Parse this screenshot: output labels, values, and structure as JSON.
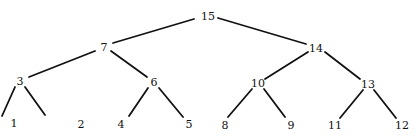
{
  "diagram": {
    "type": "binary-tree",
    "nodes": [
      {
        "id": "n15",
        "label": "15",
        "x": 208,
        "y": 16
      },
      {
        "id": "n7",
        "label": "7",
        "x": 104,
        "y": 47
      },
      {
        "id": "n14",
        "label": "14",
        "x": 316,
        "y": 48
      },
      {
        "id": "n3",
        "label": "3",
        "x": 20,
        "y": 81
      },
      {
        "id": "n6",
        "label": "6",
        "x": 154,
        "y": 82
      },
      {
        "id": "n10",
        "label": "10",
        "x": 258,
        "y": 83
      },
      {
        "id": "n13",
        "label": "13",
        "x": 368,
        "y": 84
      },
      {
        "id": "n1",
        "label": "1",
        "x": 14,
        "y": 123
      },
      {
        "id": "n2",
        "label": "2",
        "x": 81,
        "y": 124
      },
      {
        "id": "n4",
        "label": "4",
        "x": 121,
        "y": 124
      },
      {
        "id": "n5",
        "label": "5",
        "x": 189,
        "y": 124
      },
      {
        "id": "n8",
        "label": "8",
        "x": 225,
        "y": 125
      },
      {
        "id": "n9",
        "label": "9",
        "x": 291,
        "y": 125
      },
      {
        "id": "n11",
        "label": "11",
        "x": 335,
        "y": 125
      },
      {
        "id": "n12",
        "label": "12",
        "x": 402,
        "y": 125
      }
    ],
    "edges": [
      {
        "from": "n15",
        "to": "n7",
        "x1": 194,
        "y1": 19,
        "x2": 113,
        "y2": 43
      },
      {
        "from": "n15",
        "to": "n14",
        "x1": 218,
        "y1": 18,
        "x2": 306,
        "y2": 44
      },
      {
        "from": "n7",
        "to": "n3",
        "x1": 95,
        "y1": 51,
        "x2": 29,
        "y2": 77
      },
      {
        "from": "n7",
        "to": "n6",
        "x1": 111,
        "y1": 51,
        "x2": 147,
        "y2": 77
      },
      {
        "from": "n14",
        "to": "n10",
        "x1": 308,
        "y1": 52,
        "x2": 265,
        "y2": 79
      },
      {
        "from": "n14",
        "to": "n13",
        "x1": 325,
        "y1": 52,
        "x2": 360,
        "y2": 79
      },
      {
        "from": "n3",
        "to": "n1",
        "x1": 15,
        "y1": 87,
        "x2": 2,
        "y2": 116
      },
      {
        "from": "n3",
        "to": "n2",
        "x1": 25,
        "y1": 87,
        "x2": 45,
        "y2": 115
      },
      {
        "from": "n6",
        "to": "n4",
        "x1": 148,
        "y1": 88,
        "x2": 129,
        "y2": 116
      },
      {
        "from": "n6",
        "to": "n5",
        "x1": 159,
        "y1": 88,
        "x2": 183,
        "y2": 117
      },
      {
        "from": "n10",
        "to": "n8",
        "x1": 252,
        "y1": 89,
        "x2": 228,
        "y2": 117
      },
      {
        "from": "n10",
        "to": "n9",
        "x1": 264,
        "y1": 89,
        "x2": 285,
        "y2": 117
      },
      {
        "from": "n13",
        "to": "n11",
        "x1": 363,
        "y1": 90,
        "x2": 340,
        "y2": 118
      },
      {
        "from": "n13",
        "to": "n12",
        "x1": 374,
        "y1": 90,
        "x2": 396,
        "y2": 118
      }
    ],
    "colors": {
      "edge": "#111111",
      "label": "#111111",
      "background": "#ffffff"
    }
  }
}
